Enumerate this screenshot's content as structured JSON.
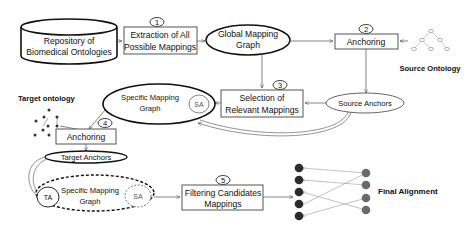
{
  "diagram": {
    "repository": {
      "line1": "Repository of",
      "line2": "Biomedical Ontologies"
    },
    "steps": [
      {
        "number": "1",
        "line1": "Extraction of All",
        "line2": "Possible Mappings"
      },
      {
        "number": "2",
        "line1": "Anchoring",
        "line2": ""
      },
      {
        "number": "3",
        "line1": "Selection of",
        "line2": "Relevant Mappings"
      },
      {
        "number": "4",
        "line1": "Anchoring",
        "line2": ""
      },
      {
        "number": "5",
        "line1": "Filtering Candidates",
        "line2": "Mappings"
      }
    ],
    "global_graph": {
      "line1": "Global Mapping",
      "line2": "Graph"
    },
    "source_ontology_label": "Source Ontology",
    "target_ontology_label": "Target ontology",
    "source_anchors_label": "Source Anchors",
    "target_anchors_label": "Target Anchors",
    "specific_graph_1": {
      "line1": "Specific Mapping",
      "line2": "Graph",
      "badge": "SA"
    },
    "specific_graph_2": {
      "line1": "Specific Mapping",
      "line2": "Graph",
      "badge_left": "TA",
      "badge_right": "SA"
    },
    "final_alignment_label": "Final Alignment",
    "colors": {
      "left_nodes": "#2b2b2b",
      "right_nodes": "#6a6a6a",
      "source_tree_nodes": "#9a9a9a"
    }
  }
}
